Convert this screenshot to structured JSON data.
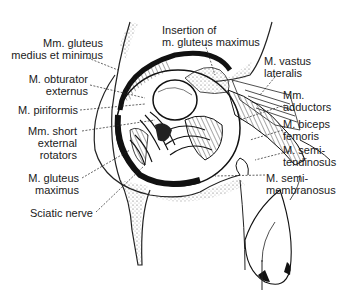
{
  "figure": {
    "labels": [
      {
        "id": "gluteus-medius-minimus",
        "text": "Mm. gluteus\nmedius et minimus",
        "side": "left"
      },
      {
        "id": "obturator-externus",
        "text": "M. obturator\nexternus",
        "side": "left"
      },
      {
        "id": "piriformis",
        "text": "M. piriformis",
        "side": "left"
      },
      {
        "id": "short-external-rotators",
        "text": "Mm. short\nexternal\nrotators",
        "side": "left"
      },
      {
        "id": "gluteus-maximus",
        "text": "M. gluteus\nmaximus",
        "side": "left"
      },
      {
        "id": "sciatic-nerve",
        "text": "Sciatic nerve",
        "side": "left"
      },
      {
        "id": "insertion-gluteus-maximus",
        "text": "Insertion of\nm. gluteus maximus",
        "side": "top"
      },
      {
        "id": "vastus-lateralis",
        "text": "M. vastus\nlateralis",
        "side": "right"
      },
      {
        "id": "adductors",
        "text": "Mm.\nadductors",
        "side": "right"
      },
      {
        "id": "biceps-femoris",
        "text": "M. biceps\nfemoris",
        "side": "right"
      },
      {
        "id": "semitendinosus",
        "text": "M. semi-\ntendinosus",
        "side": "right"
      },
      {
        "id": "semimembranosus",
        "text": "M. semi-\nmembranosus",
        "side": "right"
      }
    ]
  }
}
